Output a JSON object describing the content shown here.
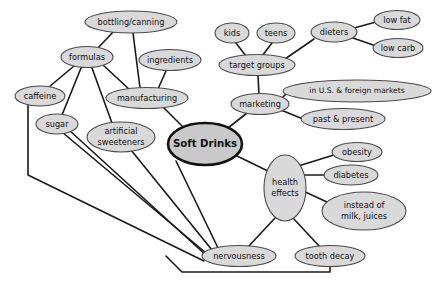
{
  "diagram": {
    "type": "mind-map",
    "colors": {
      "node_fill": "#d9d9d9",
      "node_stroke": "#4a4a4a",
      "central_fill": "#c9c9c9",
      "central_stroke": "#111111",
      "edge": "#1a1a1a",
      "background": "#ffffff",
      "text": "#101010"
    },
    "nodes": [
      {
        "id": "soft-drinks",
        "label": "Soft Drinks",
        "lines": [
          "Soft Drinks"
        ],
        "cx": 205,
        "cy": 144,
        "rx": 37,
        "ry": 21,
        "central": true
      },
      {
        "id": "bottling-canning",
        "label": "bottling/canning",
        "lines": [
          "bottling/canning"
        ],
        "cx": 131,
        "cy": 22,
        "rx": 46,
        "ry": 11
      },
      {
        "id": "formulas",
        "label": "formulas",
        "lines": [
          "formulas"
        ],
        "cx": 87,
        "cy": 57,
        "rx": 26,
        "ry": 10.5
      },
      {
        "id": "ingredients",
        "label": "ingredients",
        "lines": [
          "ingredients"
        ],
        "cx": 170,
        "cy": 60,
        "rx": 31,
        "ry": 10.5
      },
      {
        "id": "manufacturing",
        "label": "manufacturing",
        "lines": [
          "manufacturing"
        ],
        "cx": 147,
        "cy": 98,
        "rx": 41,
        "ry": 10.5
      },
      {
        "id": "caffeine",
        "label": "caffeine",
        "lines": [
          "caffeine"
        ],
        "cx": 40,
        "cy": 96,
        "rx": 25,
        "ry": 10
      },
      {
        "id": "sugar",
        "label": "sugar",
        "lines": [
          "sugar"
        ],
        "cx": 57,
        "cy": 124,
        "rx": 21,
        "ry": 10
      },
      {
        "id": "artificial-sweeteners",
        "label": "artificial sweeteners",
        "lines": [
          "artificial",
          "sweeteners"
        ],
        "cx": 121,
        "cy": 137,
        "rx": 34,
        "ry": 15
      },
      {
        "id": "kids",
        "label": "kids",
        "lines": [
          "kids"
        ],
        "cx": 232,
        "cy": 33,
        "rx": 17,
        "ry": 10
      },
      {
        "id": "teens",
        "label": "teens",
        "lines": [
          "teens"
        ],
        "cx": 276,
        "cy": 33,
        "rx": 19,
        "ry": 10
      },
      {
        "id": "dieters",
        "label": "dieters",
        "lines": [
          "dieters"
        ],
        "cx": 334,
        "cy": 32,
        "rx": 23,
        "ry": 10
      },
      {
        "id": "low-fat",
        "label": "low fat",
        "lines": [
          "low fat"
        ],
        "cx": 397,
        "cy": 20,
        "rx": 23,
        "ry": 9.5
      },
      {
        "id": "low-carb",
        "label": "low carb",
        "lines": [
          "low carb"
        ],
        "cx": 398,
        "cy": 48,
        "rx": 25,
        "ry": 9.5
      },
      {
        "id": "target-groups",
        "label": "target groups",
        "lines": [
          "target groups"
        ],
        "cx": 257,
        "cy": 65,
        "rx": 38,
        "ry": 10.5
      },
      {
        "id": "marketing",
        "label": "marketing",
        "lines": [
          "marketing"
        ],
        "cx": 260,
        "cy": 104,
        "rx": 29,
        "ry": 10.5
      },
      {
        "id": "us-foreign-markets",
        "label": "in U.S. & foreign markets",
        "lines": [
          "in U.S. & foreign markets"
        ],
        "cx": 357,
        "cy": 91,
        "rx": 74,
        "ry": 11
      },
      {
        "id": "past-present",
        "label": "past & present",
        "lines": [
          "past & present"
        ],
        "cx": 343,
        "cy": 119,
        "rx": 42,
        "ry": 10.5
      },
      {
        "id": "health-effects",
        "label": "health effects",
        "lines": [
          "health",
          "effects"
        ],
        "cx": 285,
        "cy": 188,
        "rx": 21,
        "ry": 33
      },
      {
        "id": "obesity",
        "label": "obesity",
        "lines": [
          "obesity"
        ],
        "cx": 357,
        "cy": 152,
        "rx": 25,
        "ry": 9.5
      },
      {
        "id": "diabetes",
        "label": "diabetes",
        "lines": [
          "diabetes"
        ],
        "cx": 351,
        "cy": 175,
        "rx": 27,
        "ry": 10
      },
      {
        "id": "instead-of-milk-juices",
        "label": "instead of milk, juices",
        "lines": [
          "instead of",
          "milk, juices"
        ],
        "cx": 364,
        "cy": 211,
        "rx": 42,
        "ry": 19
      },
      {
        "id": "nervousness",
        "label": "nervousness",
        "lines": [
          "nervousness"
        ],
        "cx": 239,
        "cy": 256,
        "rx": 37,
        "ry": 10.5
      },
      {
        "id": "tooth-decay",
        "label": "tooth decay",
        "lines": [
          "tooth decay"
        ],
        "cx": 330,
        "cy": 256,
        "rx": 35,
        "ry": 10.5
      }
    ],
    "edges": [
      {
        "id": "e-bottling-manufacturing",
        "from": "bottling/canning",
        "to": "manufacturing",
        "d": "M 133 33 L 140 88"
      },
      {
        "id": "e-formulas-bottling",
        "from": "formulas",
        "to": "bottling/canning",
        "d": "M 98 48 L 114 31"
      },
      {
        "id": "e-formulas-caffeine",
        "from": "formulas",
        "to": "caffeine",
        "d": "M 74 66 L 49 87"
      },
      {
        "id": "e-formulas-sugar",
        "from": "formulas",
        "to": "sugar",
        "d": "M 81 68 L 62 115"
      },
      {
        "id": "e-formulas-artificial",
        "from": "formulas",
        "to": "artificial sweeteners",
        "d": "M 92 68 L 112 123"
      },
      {
        "id": "e-formulas-manufacturing",
        "from": "formulas",
        "to": "manufacturing",
        "d": "M 103 65 L 130 90"
      },
      {
        "id": "e-ingredients-manufacturing",
        "from": "ingredients",
        "to": "manufacturing",
        "d": "M 166 71 L 158 89"
      },
      {
        "id": "e-manufacturing-soft",
        "from": "manufacturing",
        "to": "Soft Drinks",
        "d": "M 163 107 L 186 130"
      },
      {
        "id": "e-caffeine-down",
        "from": "caffeine",
        "to": "nervousness",
        "d": "M 28 105 L 28 175 L 204 261"
      },
      {
        "id": "e-sugar-nervousness-a",
        "from": "sugar",
        "to": "nervousness",
        "d": "M 62 132 L 206 253"
      },
      {
        "id": "e-sugar-nervousness-b",
        "from": "sugar",
        "to": "nervousness",
        "d": "M 69 130 L 208 257"
      },
      {
        "id": "e-artificial-nervousness",
        "from": "artificial sweeteners",
        "to": "nervousness",
        "d": "M 131 150 L 212 250"
      },
      {
        "id": "e-soft-nervousness",
        "from": "Soft Drinks",
        "to": "nervousness",
        "d": "M 176 161 L 219 250"
      },
      {
        "id": "e-kids-target",
        "from": "kids",
        "to": "target groups",
        "d": "M 236 43 L 246 56"
      },
      {
        "id": "e-teens-target",
        "from": "teens",
        "to": "target groups",
        "d": "M 272 43 L 262 56"
      },
      {
        "id": "e-dieters-target",
        "from": "dieters",
        "to": "target groups",
        "d": "M 314 39 L 285 59"
      },
      {
        "id": "e-dieters-lowfat",
        "from": "dieters",
        "to": "low fat",
        "d": "M 354 28 L 376 22"
      },
      {
        "id": "e-dieters-lowcarb",
        "from": "dieters",
        "to": "low carb",
        "d": "M 353 38 L 376 46"
      },
      {
        "id": "e-target-marketing",
        "from": "target groups",
        "to": "marketing",
        "d": "M 258 76 L 259 94"
      },
      {
        "id": "e-marketing-usforeign",
        "from": "marketing",
        "to": "in U.S. & foreign markets",
        "d": "M 281 99 L 288 92"
      },
      {
        "id": "e-marketing-pastpresent",
        "from": "marketing",
        "to": "past & present",
        "d": "M 281 110 L 303 119"
      },
      {
        "id": "e-soft-marketing",
        "from": "Soft Drinks",
        "to": "marketing",
        "d": "M 228 128 L 247 113"
      },
      {
        "id": "e-soft-health",
        "from": "Soft Drinks",
        "to": "health effects",
        "d": "M 235 155 L 272 173"
      },
      {
        "id": "e-health-obesity",
        "from": "health effects",
        "to": "obesity",
        "d": "M 295 167 L 337 154"
      },
      {
        "id": "e-health-diabetes",
        "from": "health effects",
        "to": "diabetes",
        "d": "M 305 175 L 326 175"
      },
      {
        "id": "e-health-instead",
        "from": "health effects",
        "to": "instead of milk, juices",
        "d": "M 301 190 L 327 202"
      },
      {
        "id": "e-health-nervousness",
        "from": "health effects",
        "to": "nervousness",
        "d": "M 275 218 L 248 247"
      },
      {
        "id": "e-health-tooth",
        "from": "health effects",
        "to": "tooth decay",
        "d": "M 293 218 L 320 247"
      },
      {
        "id": "e-tooth-bottom",
        "from": "tooth decay",
        "to": "caffeine",
        "d": "M 330 267 L 330 272 L 182 272 L 166 256"
      }
    ]
  }
}
